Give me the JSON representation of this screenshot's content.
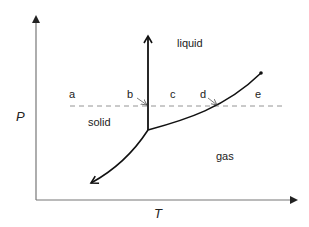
{
  "diagram": {
    "type": "phase-diagram",
    "axes": {
      "y_label": "P",
      "x_label": "T"
    },
    "regions": {
      "liquid": "liquid",
      "solid": "solid",
      "gas": "gas"
    },
    "points": {
      "a": "a",
      "b": "b",
      "c": "c",
      "d": "d",
      "e": "e"
    },
    "colors": {
      "line": "#111111",
      "axis": "#777777",
      "dashed": "#888888",
      "text": "#222222"
    }
  }
}
